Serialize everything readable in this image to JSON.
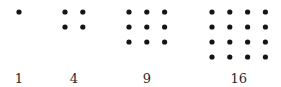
{
  "dot_color": "#151515",
  "label_color": "#2a2a2a",
  "figures": [
    {
      "side": 1,
      "label": "1"
    },
    {
      "side": 2,
      "label": "4"
    },
    {
      "side": 3,
      "label": "9"
    },
    {
      "side": 4,
      "label": "16"
    }
  ]
}
